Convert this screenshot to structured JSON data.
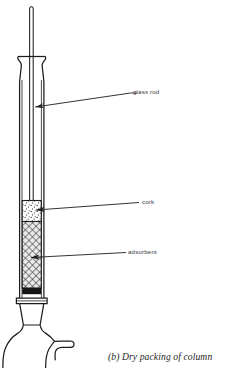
{
  "figure": {
    "caption": "(b) Dry packing of column",
    "background_color": "#ffffff",
    "line_color": "#1d1d1d",
    "label_color": "#3a3a3a"
  },
  "labels": [
    {
      "id": "glass-rod",
      "text": "glass rod"
    },
    {
      "id": "cork",
      "text": "cork"
    },
    {
      "id": "adsorbent",
      "text": "adsorbent"
    }
  ],
  "parts": {
    "glass_rod": {
      "name": "glass rod",
      "description": "thin vertical glass rod inserted down the centre of the column",
      "fill": "#ffffff",
      "stroke": "#2b2b2b"
    },
    "column_top": {
      "name": "flared column mouth",
      "description": "outward flared glass lip at the top of the column tube",
      "fill": "#ffffff",
      "stroke": "#1d1d1d"
    },
    "column_tube": {
      "name": "column tube",
      "description": "long straight glass barrel of the chromatography column",
      "fill": "#ffffff",
      "stroke": "#1d1d1d"
    },
    "cork": {
      "name": "cork",
      "description": "stippled cork plug seated in the column around the glass rod",
      "fill": "#fefefe",
      "stipple_color": "#2b2b2b"
    },
    "adsorbent": {
      "name": "adsorbent",
      "description": "cross-hatched packed adsorbent bed filling the lower column",
      "fill": "#e8e8e8",
      "hatch_color": "#2b2b2b"
    },
    "cotton_plug": {
      "name": "cotton plug",
      "description": "solid dark band supporting the adsorbent bed",
      "fill": "#151515"
    },
    "ground_joint": {
      "name": "ground glass joint",
      "description": "tapered ground glass joint connecting column to flask",
      "fill": "#ffffff",
      "stroke": "#1d1d1d"
    },
    "receiving_flask": {
      "name": "receiving flask",
      "description": "round bottom receiving flask with a side spout at lower right",
      "fill": "#ffffff",
      "stroke": "#1d1d1d"
    }
  },
  "leader_lines": {
    "stroke": "#1d1d1d",
    "arrowhead": "filled-triangle",
    "items": [
      {
        "id": "glass-rod-leader",
        "points_to": "glass rod"
      },
      {
        "id": "cork-leader",
        "points_to": "cork"
      },
      {
        "id": "adsorbent-leader",
        "points_to": "adsorbent"
      }
    ]
  }
}
